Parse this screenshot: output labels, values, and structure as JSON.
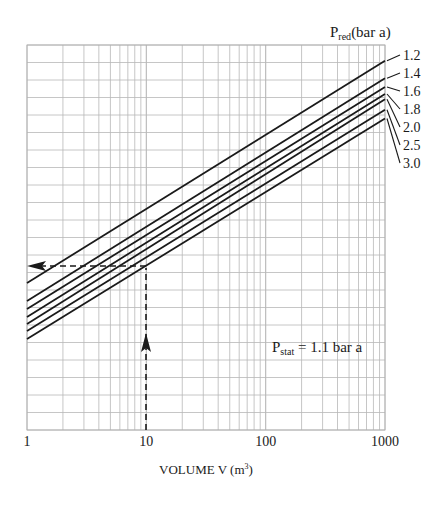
{
  "chart_data": {
    "type": "line",
    "title": "",
    "xlabel": "VOLUME V (m³)",
    "xlabel_parts": {
      "main": "VOLUME V (m",
      "sup": "3",
      "end": ")"
    },
    "ylabel": "",
    "xscale": "log",
    "xlim": [
      1,
      1000
    ],
    "ylim": [
      0,
      22
    ],
    "y_units": "grid divisions (unlabeled axis)",
    "grid": true,
    "x_ticks": [
      1,
      10,
      100,
      1000
    ],
    "x_tick_labels": [
      "1",
      "10",
      "100",
      "1000"
    ],
    "legend": {
      "title_main": "P",
      "title_sub": "red",
      "title_end": "(bar a)",
      "position": "right"
    },
    "series": [
      {
        "name": "1.2",
        "x": [
          1,
          1000
        ],
        "y": [
          8.4,
          21.1
        ]
      },
      {
        "name": "1.4",
        "x": [
          1,
          1000
        ],
        "y": [
          7.37,
          20.1
        ]
      },
      {
        "name": "1.6",
        "x": [
          1,
          1000
        ],
        "y": [
          6.91,
          19.6
        ]
      },
      {
        "name": "1.8",
        "x": [
          1,
          1000
        ],
        "y": [
          6.46,
          19.2
        ]
      },
      {
        "name": "2.0",
        "x": [
          1,
          1000
        ],
        "y": [
          6.06,
          18.9
        ]
      },
      {
        "name": "2.5",
        "x": [
          1,
          1000
        ],
        "y": [
          5.66,
          18.3
        ]
      },
      {
        "name": "3.0",
        "x": [
          1,
          1000
        ],
        "y": [
          5.2,
          17.8
        ]
      }
    ],
    "annotations": [
      {
        "type": "text",
        "main": "P",
        "sub": "stat",
        "end": " = 1.1 bar a",
        "x": 100,
        "y": 5.0
      },
      {
        "type": "arrow",
        "description": "vertical dashed arrow up from V=10",
        "x": 10,
        "y_from": 0,
        "y_to": 9.3
      },
      {
        "type": "arrow",
        "description": "horizontal dashed arrow left to y-axis",
        "y": 9.3,
        "x_from": 10,
        "x_to": 1
      }
    ]
  }
}
